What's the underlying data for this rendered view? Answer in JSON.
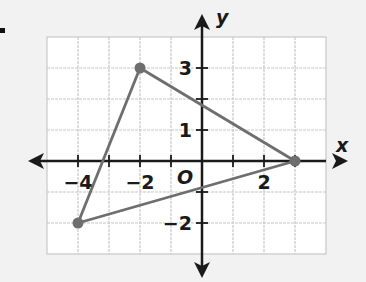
{
  "problem_marker": ".",
  "graph": {
    "x_axis_label": "x",
    "y_axis_label": "y",
    "origin_label": "O",
    "x_tick_labels": [
      {
        "value": -4,
        "text": "−4"
      },
      {
        "value": -2,
        "text": "−2"
      },
      {
        "value": 2,
        "text": "2"
      }
    ],
    "y_tick_labels": [
      {
        "value": 3,
        "text": "3"
      },
      {
        "value": 1,
        "text": "1"
      },
      {
        "value": -2,
        "text": "−2"
      }
    ],
    "grid": {
      "x_min": -5,
      "x_max": 4,
      "y_min": -3,
      "y_max": 4
    },
    "triangle_vertices": [
      {
        "x": -2,
        "y": 3
      },
      {
        "x": 3,
        "y": 0
      },
      {
        "x": -4,
        "y": -2
      }
    ],
    "colors": {
      "background": "#f2f2f2",
      "grid_fill": "#ffffff",
      "grid_line": "#c8c8c8",
      "axis": "#1a1a1a",
      "triangle": "#6e6e6e"
    }
  }
}
